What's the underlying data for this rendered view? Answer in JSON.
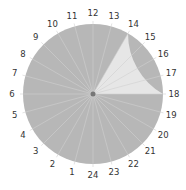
{
  "chart_data": {
    "type": "pie",
    "title": "",
    "categories": [
      "1",
      "2",
      "3",
      "4",
      "5",
      "6",
      "7",
      "8",
      "9",
      "10",
      "11",
      "12",
      "13",
      "14",
      "15",
      "16",
      "17",
      "18",
      "19",
      "20",
      "21",
      "22",
      "23",
      "24"
    ],
    "values": [
      1,
      1,
      1,
      1,
      1,
      1,
      1,
      1,
      1,
      1,
      1,
      1,
      1,
      1,
      1,
      1,
      1,
      1,
      1,
      1,
      1,
      1,
      1,
      1
    ],
    "highlight": {
      "start_hour": 14,
      "end_hour": 18
    },
    "orientation": {
      "24": "bottom",
      "6": "left",
      "12": "top",
      "18": "right"
    },
    "colors": {
      "base": "#b7b7b7",
      "highlight": "#e6e6e6",
      "spokes": "#d0d0d0",
      "center": "#777777",
      "labels": "#333333"
    }
  }
}
